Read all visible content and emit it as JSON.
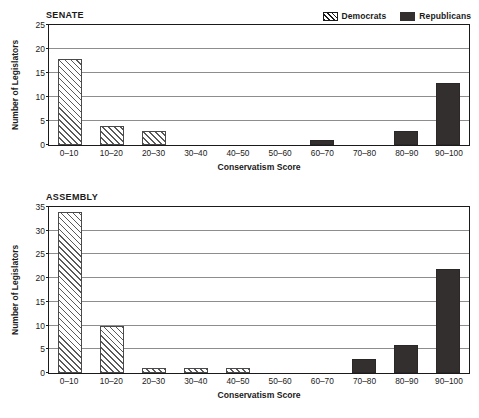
{
  "legend": {
    "items": [
      {
        "label": "Democrats",
        "pattern": "diagonal-hatch",
        "color": "#ffffff"
      },
      {
        "label": "Republicans",
        "pattern": "solid",
        "color": "#332f2e"
      }
    ]
  },
  "chart_data": [
    {
      "type": "bar",
      "title": "SENATE",
      "xlabel": "Conservatism Score",
      "ylabel": "Number of Legislators",
      "ylim": [
        0,
        25
      ],
      "yticks": [
        0,
        5,
        10,
        15,
        20,
        25
      ],
      "grid": true,
      "legend_position": "top-right",
      "categories": [
        "0–10",
        "10–20",
        "20–30",
        "30–40",
        "40–50",
        "50–60",
        "60–70",
        "70–80",
        "80–90",
        "90–100"
      ],
      "series": [
        {
          "name": "Democrats",
          "values": [
            18,
            4,
            3,
            0,
            0,
            0,
            0,
            0,
            0,
            0
          ]
        },
        {
          "name": "Republicans",
          "values": [
            0,
            0,
            0,
            0,
            0,
            0,
            1,
            0,
            3,
            13
          ]
        }
      ]
    },
    {
      "type": "bar",
      "title": "ASSEMBLY",
      "xlabel": "Conservatism Score",
      "ylabel": "Number of Legislators",
      "ylim": [
        0,
        35
      ],
      "yticks": [
        0,
        5,
        10,
        15,
        20,
        25,
        30,
        35
      ],
      "grid": true,
      "legend_position": "top-right",
      "categories": [
        "0–10",
        "10–20",
        "20–30",
        "30–40",
        "40–50",
        "50–60",
        "60–70",
        "70–80",
        "80–90",
        "90–100"
      ],
      "series": [
        {
          "name": "Democrats",
          "values": [
            34,
            10,
            1,
            1,
            1,
            0,
            0,
            0,
            0,
            0
          ]
        },
        {
          "name": "Republicans",
          "values": [
            0,
            0,
            0,
            0,
            0,
            0,
            0,
            3,
            6,
            22
          ]
        }
      ]
    }
  ]
}
